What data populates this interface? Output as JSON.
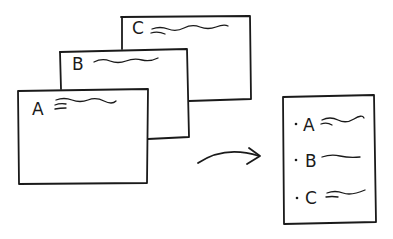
{
  "diagram": {
    "stack": [
      {
        "label": "C"
      },
      {
        "label": "B"
      },
      {
        "label": "A"
      }
    ],
    "list": {
      "items": [
        {
          "label": "A"
        },
        {
          "label": "B"
        },
        {
          "label": "C"
        }
      ]
    },
    "colors": {
      "ink": "#1a1a1a",
      "background": "#ffffff"
    }
  }
}
